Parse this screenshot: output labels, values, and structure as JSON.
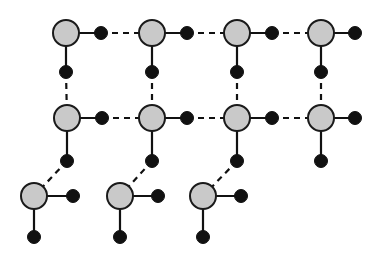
{
  "figure": {
    "title": "",
    "type": "node-link-lattice-diagram",
    "width": 375,
    "height": 258,
    "background_color": "#ffffff"
  },
  "style": {
    "large_node_fill": "#c9c9c9",
    "large_node_stroke": "#1a1a1a",
    "large_node_stroke_width": 2,
    "large_node_radius": 13,
    "small_node_fill": "#111111",
    "small_node_stroke": "#111111",
    "small_node_radius": 6.5,
    "solid_edge_color": "#111111",
    "solid_edge_width": 2.2,
    "dashed_edge_color": "#111111",
    "dashed_edge_width": 2.2,
    "dash_pattern": "6 5"
  },
  "large_nodes": [
    {
      "id": "L-r1c1",
      "label": "large-node-row1-col1",
      "x": 66,
      "y": 33
    },
    {
      "id": "L-r1c2",
      "label": "large-node-row1-col2",
      "x": 152,
      "y": 33
    },
    {
      "id": "L-r1c3",
      "label": "large-node-row1-col3",
      "x": 237,
      "y": 33
    },
    {
      "id": "L-r1c4",
      "label": "large-node-row1-col4",
      "x": 321,
      "y": 33
    },
    {
      "id": "L-r2c1",
      "label": "large-node-row2-col1",
      "x": 67,
      "y": 118
    },
    {
      "id": "L-r2c2",
      "label": "large-node-row2-col2",
      "x": 152,
      "y": 118
    },
    {
      "id": "L-r2c3",
      "label": "large-node-row2-col3",
      "x": 237,
      "y": 118
    },
    {
      "id": "L-r2c4",
      "label": "large-node-row2-col4",
      "x": 321,
      "y": 118
    },
    {
      "id": "L-r3c1",
      "label": "large-node-row3-col1",
      "x": 34,
      "y": 196
    },
    {
      "id": "L-r3c2",
      "label": "large-node-row3-col2",
      "x": 120,
      "y": 196
    },
    {
      "id": "L-r3c3",
      "label": "large-node-row3-col3",
      "x": 203,
      "y": 196
    }
  ],
  "small_nodes": [
    {
      "id": "S-r1c1-right",
      "label": "small-node-row1-col1-right",
      "x": 101,
      "y": 33
    },
    {
      "id": "S-r1c2-right",
      "label": "small-node-row1-col2-right",
      "x": 187,
      "y": 33
    },
    {
      "id": "S-r1c3-right",
      "label": "small-node-row1-col3-right",
      "x": 272,
      "y": 33
    },
    {
      "id": "S-r1c4-right",
      "label": "small-node-row1-col4-right",
      "x": 355,
      "y": 33
    },
    {
      "id": "S-r1c1-down",
      "label": "small-node-row1-col1-down",
      "x": 66,
      "y": 72
    },
    {
      "id": "S-r1c2-down",
      "label": "small-node-row1-col2-down",
      "x": 152,
      "y": 72
    },
    {
      "id": "S-r1c3-down",
      "label": "small-node-row1-col3-down",
      "x": 237,
      "y": 72
    },
    {
      "id": "S-r1c4-down",
      "label": "small-node-row1-col4-down",
      "x": 321,
      "y": 72
    },
    {
      "id": "S-r2c1-right",
      "label": "small-node-row2-col1-right",
      "x": 102,
      "y": 118
    },
    {
      "id": "S-r2c2-right",
      "label": "small-node-row2-col2-right",
      "x": 187,
      "y": 118
    },
    {
      "id": "S-r2c3-right",
      "label": "small-node-row2-col3-right",
      "x": 272,
      "y": 118
    },
    {
      "id": "S-r2c4-right",
      "label": "small-node-row2-col4-right",
      "x": 355,
      "y": 118
    },
    {
      "id": "S-r2c1-down",
      "label": "small-node-row2-col1-down",
      "x": 67,
      "y": 161
    },
    {
      "id": "S-r2c2-down",
      "label": "small-node-row2-col2-down",
      "x": 152,
      "y": 161
    },
    {
      "id": "S-r2c3-down",
      "label": "small-node-row2-col3-down",
      "x": 237,
      "y": 161
    },
    {
      "id": "S-r2c4-down",
      "label": "small-node-row2-col4-down",
      "x": 321,
      "y": 161
    },
    {
      "id": "S-r3c1-right",
      "label": "small-node-row3-col1-right",
      "x": 73,
      "y": 196
    },
    {
      "id": "S-r3c2-right",
      "label": "small-node-row3-col2-right",
      "x": 158,
      "y": 196
    },
    {
      "id": "S-r3c3-right",
      "label": "small-node-row3-col3-right",
      "x": 241,
      "y": 196
    },
    {
      "id": "S-r3c1-down",
      "label": "small-node-row3-col1-down",
      "x": 34,
      "y": 237
    },
    {
      "id": "S-r3c2-down",
      "label": "small-node-row3-col2-down",
      "x": 120,
      "y": 237
    },
    {
      "id": "S-r3c3-down",
      "label": "small-node-row3-col3-down",
      "x": 203,
      "y": 237
    }
  ],
  "solid_edges": [
    {
      "label": "edge-r1c1-to-right-dot",
      "x1": 66,
      "y1": 33,
      "x2": 101,
      "y2": 33
    },
    {
      "label": "edge-r1c2-to-right-dot",
      "x1": 152,
      "y1": 33,
      "x2": 187,
      "y2": 33
    },
    {
      "label": "edge-r1c3-to-right-dot",
      "x1": 237,
      "y1": 33,
      "x2": 272,
      "y2": 33
    },
    {
      "label": "edge-r1c4-to-right-dot",
      "x1": 321,
      "y1": 33,
      "x2": 355,
      "y2": 33
    },
    {
      "label": "edge-r1c1-to-down-dot",
      "x1": 66,
      "y1": 33,
      "x2": 66,
      "y2": 72
    },
    {
      "label": "edge-r1c2-to-down-dot",
      "x1": 152,
      "y1": 33,
      "x2": 152,
      "y2": 72
    },
    {
      "label": "edge-r1c3-to-down-dot",
      "x1": 237,
      "y1": 33,
      "x2": 237,
      "y2": 72
    },
    {
      "label": "edge-r1c4-to-down-dot",
      "x1": 321,
      "y1": 33,
      "x2": 321,
      "y2": 72
    },
    {
      "label": "edge-r2c1-to-right-dot",
      "x1": 67,
      "y1": 118,
      "x2": 102,
      "y2": 118
    },
    {
      "label": "edge-r2c2-to-right-dot",
      "x1": 152,
      "y1": 118,
      "x2": 187,
      "y2": 118
    },
    {
      "label": "edge-r2c3-to-right-dot",
      "x1": 237,
      "y1": 118,
      "x2": 272,
      "y2": 118
    },
    {
      "label": "edge-r2c4-to-right-dot",
      "x1": 321,
      "y1": 118,
      "x2": 355,
      "y2": 118
    },
    {
      "label": "edge-r2c1-to-down-dot",
      "x1": 67,
      "y1": 118,
      "x2": 67,
      "y2": 161
    },
    {
      "label": "edge-r2c2-to-down-dot",
      "x1": 152,
      "y1": 118,
      "x2": 152,
      "y2": 161
    },
    {
      "label": "edge-r2c3-to-down-dot",
      "x1": 237,
      "y1": 118,
      "x2": 237,
      "y2": 161
    },
    {
      "label": "edge-r2c4-to-down-dot",
      "x1": 321,
      "y1": 118,
      "x2": 321,
      "y2": 161
    },
    {
      "label": "edge-r3c1-to-right-dot",
      "x1": 34,
      "y1": 196,
      "x2": 73,
      "y2": 196
    },
    {
      "label": "edge-r3c2-to-right-dot",
      "x1": 120,
      "y1": 196,
      "x2": 158,
      "y2": 196
    },
    {
      "label": "edge-r3c3-to-right-dot",
      "x1": 203,
      "y1": 196,
      "x2": 241,
      "y2": 196
    },
    {
      "label": "edge-r3c1-to-down-dot",
      "x1": 34,
      "y1": 196,
      "x2": 34,
      "y2": 237
    },
    {
      "label": "edge-r3c2-to-down-dot",
      "x1": 120,
      "y1": 196,
      "x2": 120,
      "y2": 237
    },
    {
      "label": "edge-r3c3-to-down-dot",
      "x1": 203,
      "y1": 196,
      "x2": 203,
      "y2": 237
    }
  ],
  "dashed_edges": [
    {
      "label": "dashed-edge-r1-dot1-to-node2",
      "x1": 101,
      "y1": 33,
      "x2": 152,
      "y2": 33
    },
    {
      "label": "dashed-edge-r1-dot2-to-node3",
      "x1": 187,
      "y1": 33,
      "x2": 237,
      "y2": 33
    },
    {
      "label": "dashed-edge-r1-dot3-to-node4",
      "x1": 272,
      "y1": 33,
      "x2": 321,
      "y2": 33
    },
    {
      "label": "dashed-edge-r2-dot1-to-node2",
      "x1": 102,
      "y1": 118,
      "x2": 152,
      "y2": 118
    },
    {
      "label": "dashed-edge-r2-dot2-to-node3",
      "x1": 187,
      "y1": 118,
      "x2": 237,
      "y2": 118
    },
    {
      "label": "dashed-edge-r2-dot3-to-node4",
      "x1": 272,
      "y1": 118,
      "x2": 321,
      "y2": 118
    },
    {
      "label": "dashed-edge-col1-row1dot-to-row2node",
      "x1": 66,
      "y1": 72,
      "x2": 67,
      "y2": 118
    },
    {
      "label": "dashed-edge-col2-row1dot-to-row2node",
      "x1": 152,
      "y1": 72,
      "x2": 152,
      "y2": 118
    },
    {
      "label": "dashed-edge-col3-row1dot-to-row2node",
      "x1": 237,
      "y1": 72,
      "x2": 237,
      "y2": 118
    },
    {
      "label": "dashed-edge-col4-row1dot-to-row2node",
      "x1": 321,
      "y1": 72,
      "x2": 321,
      "y2": 118
    },
    {
      "label": "dashed-edge-diagonal-col1-to-row3node1",
      "x1": 67,
      "y1": 161,
      "x2": 34,
      "y2": 196
    },
    {
      "label": "dashed-edge-diagonal-col2-to-row3node2",
      "x1": 152,
      "y1": 161,
      "x2": 120,
      "y2": 196
    },
    {
      "label": "dashed-edge-diagonal-col3-to-row3node3",
      "x1": 237,
      "y1": 161,
      "x2": 203,
      "y2": 196
    }
  ]
}
